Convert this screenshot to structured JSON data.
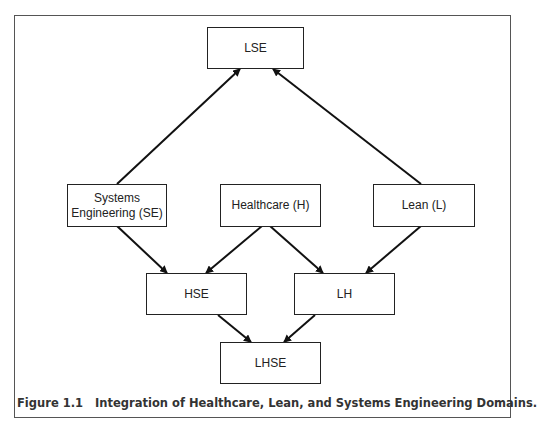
{
  "diagram": {
    "nodes": {
      "lse": {
        "label": "LSE"
      },
      "se": {
        "label_line1": "Systems",
        "label_line2": "Engineering (SE)"
      },
      "h": {
        "label": "Healthcare (H)"
      },
      "l": {
        "label": "Lean (L)"
      },
      "hse": {
        "label": "HSE"
      },
      "lh": {
        "label": "LH"
      },
      "lhse": {
        "label": "LHSE"
      }
    },
    "edges": [
      {
        "from": "Systems Engineering (SE)",
        "to": "LSE"
      },
      {
        "from": "Lean (L)",
        "to": "LSE"
      },
      {
        "from": "Systems Engineering (SE)",
        "to": "HSE"
      },
      {
        "from": "Healthcare (H)",
        "to": "HSE"
      },
      {
        "from": "Healthcare (H)",
        "to": "LH"
      },
      {
        "from": "Lean (L)",
        "to": "LH"
      },
      {
        "from": "HSE",
        "to": "LHSE"
      },
      {
        "from": "LH",
        "to": "LHSE"
      }
    ]
  },
  "caption": {
    "number": "Figure 1.1",
    "text": "Integration of Healthcare, Lean, and Systems Engineering Domains."
  }
}
